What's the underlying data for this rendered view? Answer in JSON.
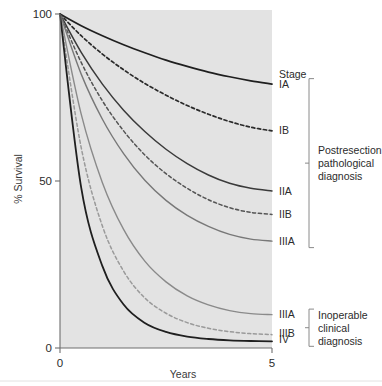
{
  "figure": {
    "background_color": "#ffffff",
    "plot_background_color": "#e3e3e3",
    "axis_color": "#6e6e6e"
  },
  "chart_data": {
    "type": "line",
    "title": "",
    "xlabel": "Years",
    "ylabel": "% Survival",
    "xlim": [
      0,
      5
    ],
    "ylim": [
      0,
      100
    ],
    "xticks": [
      0,
      5
    ],
    "xtick_labels": [
      "0",
      "5"
    ],
    "yticks": [
      0,
      50,
      100
    ],
    "ytick_labels": [
      "0",
      "50",
      "100"
    ],
    "grid": false,
    "legend_position": "right",
    "series": [
      {
        "name": "IA",
        "label": "IA",
        "group": "Postresection pathological diagnosis",
        "style": "solid",
        "color": "#1f1f1f",
        "width": 1.7,
        "x": [
          0,
          0.5,
          1,
          1.5,
          2,
          2.5,
          3,
          3.5,
          4,
          4.5,
          5
        ],
        "y": [
          100,
          96.5,
          93.5,
          90.8,
          88.4,
          86.2,
          84.3,
          82.6,
          81.2,
          80.0,
          79.0
        ]
      },
      {
        "name": "IB",
        "label": "IB",
        "group": "Postresection pathological diagnosis",
        "style": "dashed",
        "color": "#2a2a2a",
        "width": 1.7,
        "x": [
          0,
          0.5,
          1,
          1.5,
          2,
          2.5,
          3,
          3.5,
          4,
          4.5,
          5
        ],
        "y": [
          100,
          93.5,
          88.0,
          83.3,
          79.2,
          75.7,
          72.6,
          70.0,
          67.8,
          66.1,
          65.0
        ]
      },
      {
        "name": "IIA",
        "label": "IIA",
        "group": "Postresection pathological diagnosis",
        "style": "solid",
        "color": "#3a3a3a",
        "width": 1.5,
        "x": [
          0,
          0.5,
          1,
          1.5,
          2,
          2.5,
          3,
          3.5,
          4,
          4.5,
          5
        ],
        "y": [
          100,
          88.5,
          79.0,
          71.2,
          64.8,
          59.5,
          55.2,
          51.8,
          49.3,
          47.8,
          47.0
        ]
      },
      {
        "name": "IIB",
        "label": "IIB",
        "group": "Postresection pathological diagnosis",
        "style": "dashed",
        "color": "#555555",
        "width": 1.5,
        "x": [
          0,
          0.5,
          1,
          1.5,
          2,
          2.5,
          3,
          3.5,
          4,
          4.5,
          5
        ],
        "y": [
          100,
          85.5,
          74.0,
          65.0,
          57.8,
          52.2,
          47.8,
          44.4,
          42.0,
          40.6,
          40.0
        ]
      },
      {
        "name": "IIIA-postresection",
        "label": "IIIA",
        "group": "Postresection pathological diagnosis",
        "style": "solid",
        "color": "#787878",
        "width": 1.4,
        "x": [
          0,
          0.5,
          1,
          1.5,
          2,
          2.5,
          3,
          3.5,
          4,
          4.5,
          5
        ],
        "y": [
          100,
          82.0,
          68.5,
          58.2,
          50.2,
          44.2,
          39.7,
          36.4,
          34.0,
          32.6,
          32.0
        ]
      },
      {
        "name": "IIIA-inoperable",
        "label": "IIIA",
        "group": "Inoperable clinical diagnosis",
        "style": "solid",
        "color": "#8a8a8a",
        "width": 1.4,
        "x": [
          0,
          0.5,
          1,
          1.5,
          2,
          2.5,
          3,
          3.5,
          4,
          4.5,
          5
        ],
        "y": [
          100,
          70.0,
          49.5,
          35.5,
          26.0,
          19.8,
          15.6,
          12.9,
          11.2,
          10.3,
          10.0
        ]
      },
      {
        "name": "IIIB",
        "label": "IIIB",
        "group": "Inoperable clinical diagnosis",
        "style": "dashed",
        "color": "#9a9a9a",
        "width": 1.5,
        "x": [
          0,
          0.5,
          1,
          1.5,
          2,
          2.5,
          3,
          3.5,
          4,
          4.5,
          5
        ],
        "y": [
          100,
          60.0,
          36.5,
          23.0,
          15.0,
          10.4,
          7.6,
          5.9,
          4.9,
          4.3,
          4.0
        ]
      },
      {
        "name": "IV",
        "label": "IV",
        "group": "Inoperable clinical diagnosis",
        "style": "solid",
        "color": "#1f1f1f",
        "width": 1.8,
        "x": [
          0,
          0.5,
          1,
          1.5,
          2,
          2.5,
          3,
          3.5,
          4,
          4.5,
          5
        ],
        "y": [
          100,
          48.0,
          24.5,
          13.0,
          7.5,
          4.8,
          3.4,
          2.7,
          2.3,
          2.1,
          2.0
        ]
      }
    ]
  },
  "legend": {
    "header": "Stage",
    "entries": [
      {
        "label": "IA",
        "value": 79.0
      },
      {
        "label": "IB",
        "value": 65.0
      },
      {
        "label": "IIA",
        "value": 47.0
      },
      {
        "label": "IIB",
        "value": 40.0
      },
      {
        "label": "IIIA",
        "value": 32.0
      },
      {
        "label": "IIIA",
        "value": 10.0
      },
      {
        "label": "IIIB",
        "value": 4.0
      },
      {
        "label": "IV",
        "value": 2.0
      }
    ],
    "groups": [
      {
        "name": "postresection",
        "lines": [
          "Postresection",
          "pathological",
          "diagnosis"
        ],
        "members": [
          "IA",
          "IB",
          "IIA",
          "IIB",
          "IIIA"
        ]
      },
      {
        "name": "inoperable",
        "lines": [
          "Inoperable",
          "clinical",
          "diagnosis"
        ],
        "members": [
          "IIIA",
          "IIIB",
          "IV"
        ]
      }
    ]
  }
}
